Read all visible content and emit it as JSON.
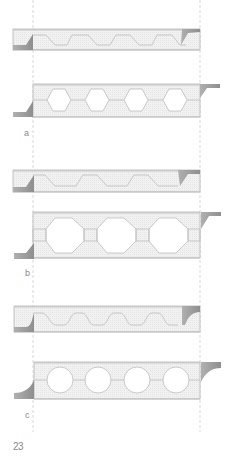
{
  "figure": {
    "panels": [
      {
        "id": "a",
        "label": "a",
        "void_shape": "trapezoidal / hexagonal",
        "voids_top": 4,
        "voids_bottom": 4
      },
      {
        "id": "b",
        "label": "b",
        "void_shape": "trapezoidal / octagonal",
        "voids_top": 3,
        "voids_bottom": 3
      },
      {
        "id": "c",
        "label": "c",
        "void_shape": "rounded / circular",
        "voids_top": 4,
        "voids_bottom": 4
      }
    ],
    "page_number": "23"
  },
  "colors": {
    "slab_fill": "#f2f2f2",
    "slab_stroke": "#b5b5b5",
    "void_stroke": "#bdbdbd",
    "nib_fill": "#9e9e9e",
    "nib_fill_light": "#c4c4c4",
    "dash_line": "#c8c8c8",
    "text": "#8a8a8a"
  }
}
